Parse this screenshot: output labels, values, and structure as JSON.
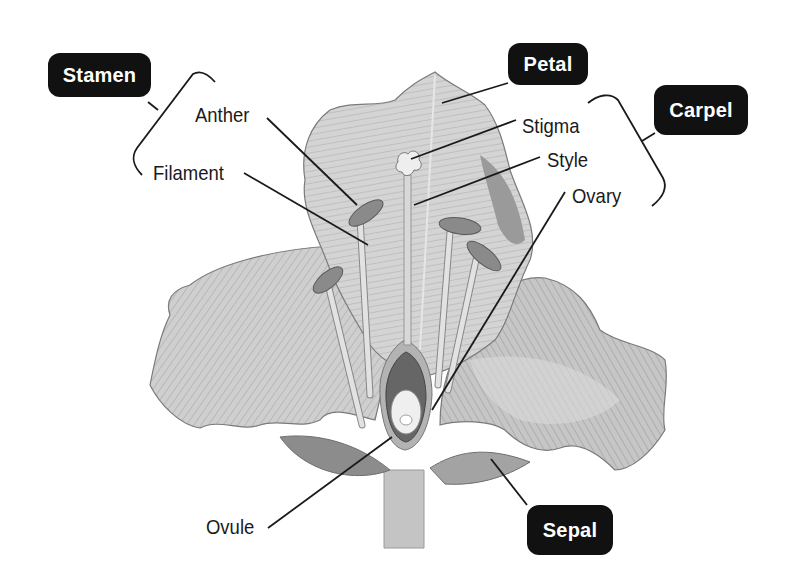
{
  "diagram": {
    "group_labels": {
      "stamen": "Stamen",
      "petal": "Petal",
      "carpel": "Carpel",
      "sepal": "Sepal"
    },
    "part_labels": {
      "anther": "Anther",
      "filament": "Filament",
      "stigma": "Stigma",
      "style": "Style",
      "ovary": "Ovary",
      "ovule": "Ovule"
    },
    "colors": {
      "badge_bg": "#111111",
      "badge_text": "#ffffff",
      "label_text": "#1a1a1a",
      "petal_light": "#d6d6d6",
      "petal_mid": "#bdbdbd",
      "petal_dark": "#8f8f8f",
      "outline": "#6e6e6e"
    }
  }
}
